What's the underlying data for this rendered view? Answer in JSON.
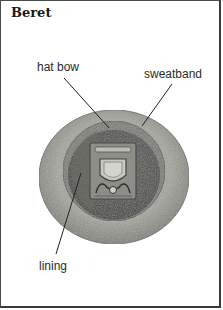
{
  "title": "Beret",
  "labels": {
    "hat_bow": "hat bow",
    "sweatband": "sweatband",
    "lining": "lining"
  },
  "colors": {
    "brim": "#9a9a92",
    "interior": "#4a4a46",
    "badge": "#8a8a84",
    "border": "#3a3a3a"
  }
}
